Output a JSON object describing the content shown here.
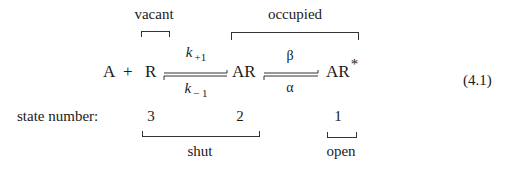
{
  "scheme": {
    "groups_top": {
      "vacant": "vacant",
      "occupied": "occupied"
    },
    "species": {
      "A": "A",
      "plus": "+",
      "R": "R",
      "AR": "AR",
      "AR_star": "AR",
      "star": "*"
    },
    "rates": {
      "k_forward": {
        "symbol": "k",
        "subscript": "+1"
      },
      "k_backward": {
        "symbol": "k",
        "subscript": "− 1"
      },
      "beta": "β",
      "alpha": "α"
    },
    "equation_number": "(4.1)",
    "state_row": {
      "label": "state number:",
      "states": [
        "3",
        "2",
        "1"
      ]
    },
    "groups_bottom": {
      "shut": "shut",
      "open": "open"
    }
  },
  "colors": {
    "text": "#1a1a1a",
    "lines": "#333333",
    "background": "#ffffff"
  }
}
